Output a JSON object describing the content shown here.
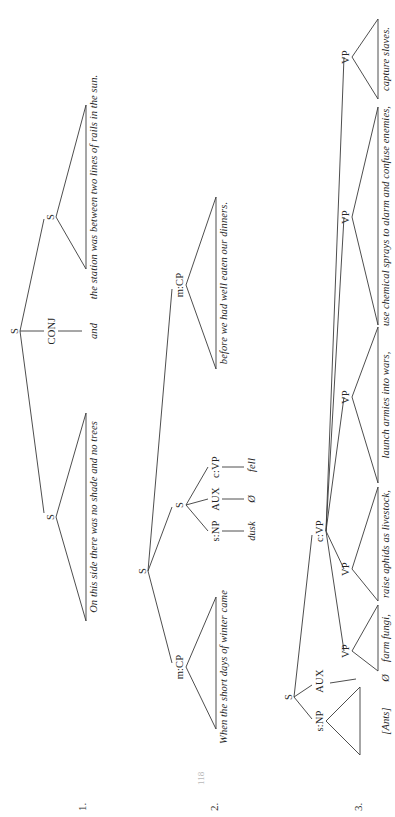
{
  "page": {
    "background_color": "#ffffff",
    "ink_color": "#3a3a3a",
    "page_number": "118",
    "orientation": "rotated-90-ccw"
  },
  "trees": [
    {
      "number": "1.",
      "root_label": "S",
      "nodes": {
        "root": "S",
        "left_s": "S",
        "conj": "CONJ",
        "right_s": "S"
      },
      "leaves": {
        "left_clause": "On this side there was no shade and no trees",
        "conjunction": "and",
        "right_clause": "the station was between two lines of rails in the sun."
      }
    },
    {
      "number": "2.",
      "root_label": "S",
      "nodes": {
        "root": "S",
        "m_cp": "m:CP",
        "inner_s": "S",
        "s_np": "s:NP",
        "aux": "AUX",
        "c_vp": "c:VP"
      },
      "leaves": {
        "m_cp_text": "When the short days of winter came",
        "subject": "dusk",
        "aux_text": "Ø",
        "verb": "fell",
        "trailing_cp": "before we had well eaten our dinners."
      }
    },
    {
      "number": "3.",
      "root_label": "S",
      "nodes": {
        "root": "S",
        "s_np": "s:NP",
        "aux": "AUX",
        "c_vp": "c:VP",
        "vp_1": "VP",
        "vp_2": "VP",
        "vp_3": "VP",
        "vp_4": "VP",
        "vp_5": "VP"
      },
      "leaves": {
        "subject": "[Ants]",
        "aux_text": "Ø",
        "vp_1_text": "farm fungi,",
        "vp_2_text": "raise aphids as livestock,",
        "vp_3_text": "launch armies into wars,",
        "vp_4_text": "use chemical sprays to alarm and confuse enemies,",
        "vp_5_text": "capture slaves."
      }
    }
  ]
}
